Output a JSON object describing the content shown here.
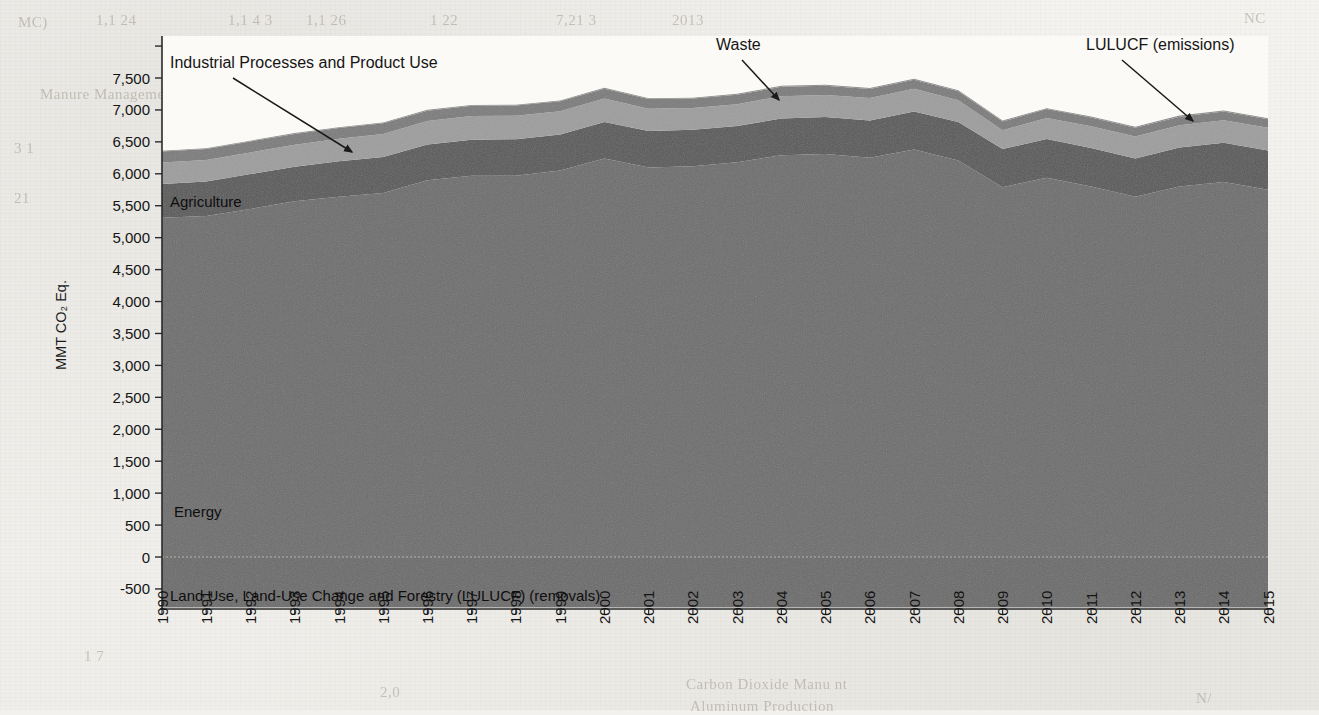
{
  "figure": {
    "background_color": "#f2f1ee",
    "plot_background": "#fbfaf7"
  },
  "axes": {
    "y_axis_title": "MMT CO₂ Eq.",
    "y_ticks": [
      "7,500",
      "7,000",
      "6,500",
      "6,000",
      "5,500",
      "5,000",
      "4,500",
      "4,000",
      "3,500",
      "3,000",
      "2,500",
      "2,000",
      "1,500",
      "1,000",
      "500",
      "0",
      "-500"
    ],
    "y_tick_values": [
      7500,
      7000,
      6500,
      6000,
      5500,
      5000,
      4500,
      4000,
      3500,
      3000,
      2500,
      2000,
      1500,
      1000,
      500,
      0,
      -500
    ],
    "x_ticks": [
      "1990",
      "1991",
      "1992",
      "1993",
      "1994",
      "1995",
      "1996",
      "1997",
      "1998",
      "1999",
      "2000",
      "2001",
      "2002",
      "2003",
      "2004",
      "2005",
      "2006",
      "2007",
      "2008",
      "2009",
      "2010",
      "2011",
      "2012",
      "2013",
      "2014",
      "2015"
    ],
    "axis_color": "#2a2a2a"
  },
  "annotations": [
    {
      "name": "industrial-processes",
      "text": "Industrial Processes and Product Use",
      "label_x": 170,
      "label_y": 68,
      "arrow_x1": 233,
      "arrow_y1": 78,
      "arrow_x2": 352,
      "arrow_y2": 152
    },
    {
      "name": "waste",
      "text": "Waste",
      "label_x": 716,
      "label_y": 50,
      "arrow_x1": 742,
      "arrow_y1": 60,
      "arrow_x2": 779,
      "arrow_y2": 100
    },
    {
      "name": "lulucf-emissions",
      "text": "LULUCF (emissions)",
      "label_x": 1086,
      "label_y": 50,
      "arrow_x1": 1122,
      "arrow_y1": 60,
      "arrow_x2": 1193,
      "arrow_y2": 121
    }
  ],
  "inband_labels": [
    {
      "name": "agriculture",
      "text": "Agriculture",
      "x": 170,
      "y": 207
    },
    {
      "name": "energy",
      "text": "Energy",
      "x": 174,
      "y": 517
    },
    {
      "name": "lulucf-removals",
      "text": "Land Use, Land-Use Change and Forestry (LULUCF) (removals)",
      "x": 170,
      "y": 601
    }
  ],
  "chart_data": {
    "type": "area",
    "stacked": true,
    "title": "",
    "xlabel": "",
    "ylabel": "MMT CO₂ Eq.",
    "ylim": [
      -900,
      7800
    ],
    "grid": false,
    "legend": "in-plot annotations",
    "x": [
      1990,
      1991,
      1992,
      1993,
      1994,
      1995,
      1996,
      1997,
      1998,
      1999,
      2000,
      2001,
      2002,
      2003,
      2004,
      2005,
      2006,
      2007,
      2008,
      2009,
      2010,
      2011,
      2012,
      2013,
      2014,
      2015
    ],
    "series": [
      {
        "name": "Energy",
        "color": "#6d6d6d",
        "values": [
          5310,
          5340,
          5450,
          5570,
          5640,
          5700,
          5900,
          5970,
          5970,
          6050,
          6240,
          6100,
          6120,
          6180,
          6290,
          6310,
          6250,
          6380,
          6210,
          5790,
          5940,
          5800,
          5640,
          5800,
          5870,
          5750
        ]
      },
      {
        "name": "Agriculture",
        "color": "#585858",
        "values": [
          530,
          540,
          545,
          540,
          555,
          565,
          560,
          565,
          570,
          565,
          570,
          570,
          570,
          570,
          575,
          580,
          585,
          595,
          600,
          600,
          605,
          605,
          600,
          610,
          615,
          615
        ]
      },
      {
        "name": "Industrial Processes and Product Use",
        "color": "#9d9d9d",
        "values": [
          335,
          335,
          340,
          345,
          355,
          360,
          365,
          370,
          370,
          365,
          370,
          350,
          340,
          340,
          350,
          345,
          350,
          355,
          340,
          290,
          330,
          340,
          345,
          350,
          355,
          355
        ]
      },
      {
        "name": "Waste",
        "color": "#7b7b7b",
        "values": [
          175,
          175,
          172,
          170,
          168,
          165,
          163,
          160,
          158,
          155,
          152,
          150,
          148,
          148,
          147,
          145,
          144,
          143,
          142,
          140,
          138,
          137,
          136,
          135,
          134,
          133
        ]
      },
      {
        "name": "LULUCF (emissions)",
        "color": "#8a8a8a",
        "values": [
          11,
          10,
          11,
          12,
          12,
          13,
          13,
          14,
          14,
          14,
          14,
          13,
          13,
          14,
          15,
          15,
          15,
          16,
          15,
          13,
          14,
          15,
          15,
          16,
          16,
          16
        ]
      }
    ],
    "negative_series": [
      {
        "name": "Land Use, Land-Use Change and Forestry (LULUCF) (removals)",
        "color": "#6a6a6a",
        "values": [
          -790,
          -790,
          -790,
          -790,
          -790,
          -790,
          -790,
          -790,
          -790,
          -790,
          -790,
          -790,
          -790,
          -790,
          -790,
          -790,
          -790,
          -790,
          -790,
          -790,
          -790,
          -790,
          -790,
          -790,
          -790,
          -790
        ]
      }
    ],
    "stack_totals": [
      6361,
      6400,
      6518,
      6637,
      6730,
      6803,
      7001,
      7079,
      7082,
      7149,
      7346,
      7183,
      7191,
      7252,
      7377,
      7395,
      7344,
      7489,
      7307,
      6833,
      7027,
      6897,
      6736,
      6911,
      6990,
      6869
    ]
  },
  "ghost_text": [
    {
      "text": "MC)",
      "x": 18,
      "y": 14
    },
    {
      "text": "1,1 24",
      "x": 96,
      "y": 12
    },
    {
      "text": "1,1 4 3",
      "x": 228,
      "y": 12
    },
    {
      "text": "1,1 26",
      "x": 306,
      "y": 12
    },
    {
      "text": "1 22",
      "x": 430,
      "y": 12
    },
    {
      "text": "7,21 3",
      "x": 556,
      "y": 12
    },
    {
      "text": "2013",
      "x": 672,
      "y": 12
    },
    {
      "text": "1 1",
      "x": 740,
      "y": 36
    },
    {
      "text": "Nitrogen",
      "x": 850,
      "y": 40
    },
    {
      "text": "Stationary Combustion",
      "x": 930,
      "y": 44
    },
    {
      "text": "Mobile Combustion",
      "x": 924,
      "y": 66
    },
    {
      "text": "Manure Management",
      "x": 40,
      "y": 86
    },
    {
      "text": "III",
      "x": 744,
      "y": 58
    },
    {
      "text": "10",
      "x": 310,
      "y": 112
    },
    {
      "text": "3 1",
      "x": 14,
      "y": 140
    },
    {
      "text": "21",
      "x": 14,
      "y": 190
    },
    {
      "text": "1.0",
      "x": 1196,
      "y": 256
    },
    {
      "text": "Carbon Dioxide Manu nt",
      "x": 686,
      "y": 676
    },
    {
      "text": "Aluminum Production",
      "x": 690,
      "y": 698
    },
    {
      "text": "1 7",
      "x": 84,
      "y": 648
    },
    {
      "text": "N/",
      "x": 1196,
      "y": 690
    },
    {
      "text": "2,0",
      "x": 380,
      "y": 684
    },
    {
      "text": "NC",
      "x": 1244,
      "y": 10
    }
  ]
}
